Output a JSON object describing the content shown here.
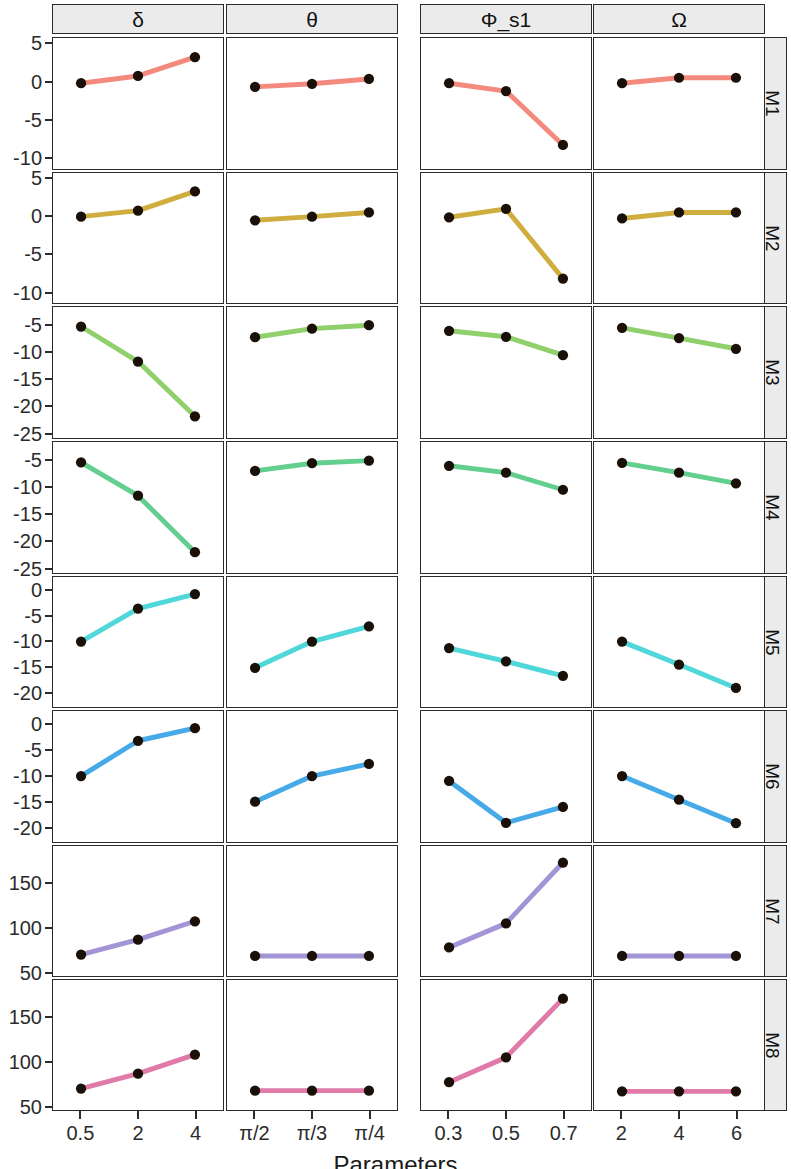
{
  "figure": {
    "xlabel": "Parameters",
    "row_labels": [
      "M1",
      "M2",
      "M3",
      "M4",
      "M5",
      "M6",
      "M7",
      "M8"
    ],
    "col_labels": [
      "δ",
      "θ",
      "Φ_s1",
      "Ω"
    ]
  },
  "chart_data": {
    "type": "line",
    "title": "",
    "xlabel": "Parameters",
    "ylabel": "",
    "grid": false,
    "legend": "none",
    "layout": "facet-grid 8 rows (M1-M8) x 4 columns (δ, θ, Φ_s1, Ω)",
    "columns": [
      {
        "name": "δ",
        "ticks": [
          "0.5",
          "2",
          "4"
        ]
      },
      {
        "name": "θ",
        "ticks": [
          "π/2",
          "π/3",
          "π/4"
        ]
      },
      {
        "name": "Φ_s1",
        "ticks": [
          "0.3",
          "0.5",
          "0.7"
        ]
      },
      {
        "name": "Ω",
        "ticks": [
          "2",
          "4",
          "6"
        ]
      }
    ],
    "row_axes": [
      {
        "row": "M1",
        "ticks": [
          5,
          0,
          -5,
          -10
        ],
        "ylim": [
          -11.5,
          5.8
        ]
      },
      {
        "row": "M2",
        "ticks": [
          5,
          0,
          -5,
          -10
        ],
        "ylim": [
          -11.5,
          5.8
        ]
      },
      {
        "row": "M3",
        "ticks": [
          -5,
          -10,
          -15,
          -20,
          -25
        ],
        "ylim": [
          -26.0,
          -1.5
        ]
      },
      {
        "row": "M4",
        "ticks": [
          -5,
          -10,
          -15,
          -20,
          -25
        ],
        "ylim": [
          -26.0,
          -1.5
        ]
      },
      {
        "row": "M5",
        "ticks": [
          0,
          -5,
          -10,
          -15,
          -20
        ],
        "ylim": [
          -23.0,
          2.8
        ]
      },
      {
        "row": "M6",
        "ticks": [
          0,
          -5,
          -10,
          -15,
          -20
        ],
        "ylim": [
          -23.0,
          2.8
        ]
      },
      {
        "row": "M7",
        "ticks": [
          50,
          100,
          150
        ],
        "ylim": [
          45,
          192
        ]
      },
      {
        "row": "M8",
        "ticks": [
          50,
          100,
          150
        ],
        "ylim": [
          45,
          192
        ]
      }
    ],
    "series_colors": {
      "M1": "#f4897e",
      "M2": "#cfae3f",
      "M3": "#8fd06a",
      "M4": "#63cf8e",
      "M5": "#4fd7d9",
      "M6": "#46a9e8",
      "M7": "#a394d6",
      "M8": "#e07aa8"
    },
    "point_color": "#1a1008",
    "panels": [
      {
        "row": "M1",
        "col": "δ",
        "x": [
          "0.5",
          "2",
          "4"
        ],
        "y": [
          0.5,
          1.7,
          4.8
        ]
      },
      {
        "row": "M1",
        "col": "θ",
        "x": [
          "π/2",
          "π/3",
          "π/4"
        ],
        "y": [
          -0.1,
          0.4,
          1.2
        ]
      },
      {
        "row": "M1",
        "col": "Φ_s1",
        "x": [
          "0.3",
          "0.5",
          "0.7"
        ],
        "y": [
          0.5,
          -0.8,
          -9.7
        ]
      },
      {
        "row": "M1",
        "col": "Ω",
        "x": [
          "2",
          "4",
          "6"
        ],
        "y": [
          0.5,
          1.4,
          1.4
        ]
      },
      {
        "row": "M2",
        "col": "δ",
        "x": [
          "0.5",
          "2",
          "4"
        ],
        "y": [
          0.7,
          1.7,
          4.9
        ]
      },
      {
        "row": "M2",
        "col": "θ",
        "x": [
          "π/2",
          "π/3",
          "π/4"
        ],
        "y": [
          0.1,
          0.7,
          1.4
        ]
      },
      {
        "row": "M2",
        "col": "Φ_s1",
        "x": [
          "0.3",
          "0.5",
          "0.7"
        ],
        "y": [
          0.6,
          2.0,
          -9.6
        ]
      },
      {
        "row": "M2",
        "col": "Ω",
        "x": [
          "2",
          "4",
          "6"
        ],
        "y": [
          0.4,
          1.4,
          1.4
        ]
      },
      {
        "row": "M3",
        "col": "δ",
        "x": [
          "0.5",
          "2",
          "4"
        ],
        "y": [
          -3.0,
          -11.2,
          -24.0
        ]
      },
      {
        "row": "M3",
        "col": "θ",
        "x": [
          "π/2",
          "π/3",
          "π/4"
        ],
        "y": [
          -5.5,
          -3.5,
          -2.7
        ]
      },
      {
        "row": "M3",
        "col": "Φ_s1",
        "x": [
          "0.3",
          "0.5",
          "0.7"
        ],
        "y": [
          -4.0,
          -5.4,
          -9.7
        ]
      },
      {
        "row": "M3",
        "col": "Ω",
        "x": [
          "2",
          "4",
          "6"
        ],
        "y": [
          -3.3,
          -5.7,
          -8.2
        ]
      },
      {
        "row": "M4",
        "col": "δ",
        "x": [
          "0.5",
          "2",
          "4"
        ],
        "y": [
          -3.2,
          -11.0,
          -24.2
        ]
      },
      {
        "row": "M4",
        "col": "θ",
        "x": [
          "π/2",
          "π/3",
          "π/4"
        ],
        "y": [
          -5.2,
          -3.4,
          -2.8
        ]
      },
      {
        "row": "M4",
        "col": "Φ_s1",
        "x": [
          "0.3",
          "0.5",
          "0.7"
        ],
        "y": [
          -4.0,
          -5.6,
          -9.6
        ]
      },
      {
        "row": "M4",
        "col": "Ω",
        "x": [
          "2",
          "4",
          "6"
        ],
        "y": [
          -3.3,
          -5.6,
          -8.1
        ]
      },
      {
        "row": "M5",
        "col": "δ",
        "x": [
          "0.5",
          "2",
          "4"
        ],
        "y": [
          -10.0,
          -1.8,
          1.8
        ]
      },
      {
        "row": "M5",
        "col": "θ",
        "x": [
          "π/2",
          "π/3",
          "π/4"
        ],
        "y": [
          -16.5,
          -10.0,
          -6.2
        ]
      },
      {
        "row": "M5",
        "col": "Φ_s1",
        "x": [
          "0.3",
          "0.5",
          "0.7"
        ],
        "y": [
          -11.6,
          -14.9,
          -18.5
        ]
      },
      {
        "row": "M5",
        "col": "Ω",
        "x": [
          "2",
          "4",
          "6"
        ],
        "y": [
          -10.0,
          -15.7,
          -21.5
        ]
      },
      {
        "row": "M6",
        "col": "δ",
        "x": [
          "0.5",
          "2",
          "4"
        ],
        "y": [
          -10.0,
          -1.3,
          1.8
        ]
      },
      {
        "row": "M6",
        "col": "θ",
        "x": [
          "π/2",
          "π/3",
          "π/4"
        ],
        "y": [
          -16.3,
          -10.0,
          -7.0
        ]
      },
      {
        "row": "M6",
        "col": "Φ_s1",
        "x": [
          "0.3",
          "0.5",
          "0.7"
        ],
        "y": [
          -11.2,
          -21.5,
          -17.6
        ]
      },
      {
        "row": "M6",
        "col": "Ω",
        "x": [
          "2",
          "4",
          "6"
        ],
        "y": [
          -10.0,
          -15.8,
          -21.6
        ]
      },
      {
        "row": "M7",
        "col": "δ",
        "x": [
          "0.5",
          "2",
          "4"
        ],
        "y": [
          57,
          78,
          104
        ]
      },
      {
        "row": "M7",
        "col": "θ",
        "x": [
          "π/2",
          "π/3",
          "π/4"
        ],
        "y": [
          55,
          55,
          55
        ]
      },
      {
        "row": "M7",
        "col": "Φ_s1",
        "x": [
          "0.3",
          "0.5",
          "0.7"
        ],
        "y": [
          67,
          101,
          187
        ]
      },
      {
        "row": "M7",
        "col": "Ω",
        "x": [
          "2",
          "4",
          "6"
        ],
        "y": [
          55,
          55,
          55
        ]
      },
      {
        "row": "M8",
        "col": "δ",
        "x": [
          "0.5",
          "2",
          "4"
        ],
        "y": [
          57,
          78,
          105
        ]
      },
      {
        "row": "M8",
        "col": "θ",
        "x": [
          "π/2",
          "π/3",
          "π/4"
        ],
        "y": [
          54,
          54,
          54
        ]
      },
      {
        "row": "M8",
        "col": "Φ_s1",
        "x": [
          "0.3",
          "0.5",
          "0.7"
        ],
        "y": [
          66,
          101,
          184
        ]
      },
      {
        "row": "M8",
        "col": "Ω",
        "x": [
          "2",
          "4",
          "6"
        ],
        "y": [
          53,
          53,
          53
        ]
      }
    ]
  }
}
